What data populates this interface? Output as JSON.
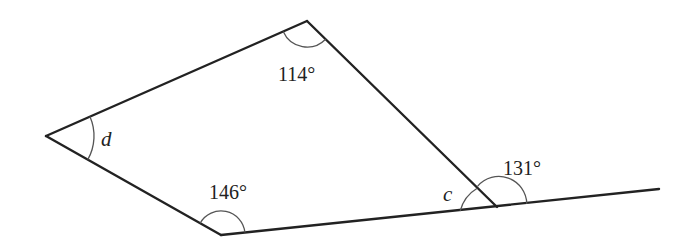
{
  "diagram": {
    "type": "quadrilateral-with-extended-side",
    "vertices": {
      "top": {
        "x": 307,
        "y": 21
      },
      "left": {
        "x": 46,
        "y": 136
      },
      "bottom": {
        "x": 221,
        "y": 235
      },
      "right": {
        "x": 497,
        "y": 207
      },
      "extension_end": {
        "x": 659,
        "y": 189
      }
    },
    "angles": [
      {
        "id": "top",
        "label": "114°",
        "kind": "interior"
      },
      {
        "id": "left",
        "label": "d",
        "kind": "unknown"
      },
      {
        "id": "bottom",
        "label": "146°",
        "kind": "interior"
      },
      {
        "id": "right-interior",
        "label": "c",
        "kind": "unknown"
      },
      {
        "id": "right-exterior",
        "label": "131°",
        "kind": "exterior"
      }
    ]
  }
}
